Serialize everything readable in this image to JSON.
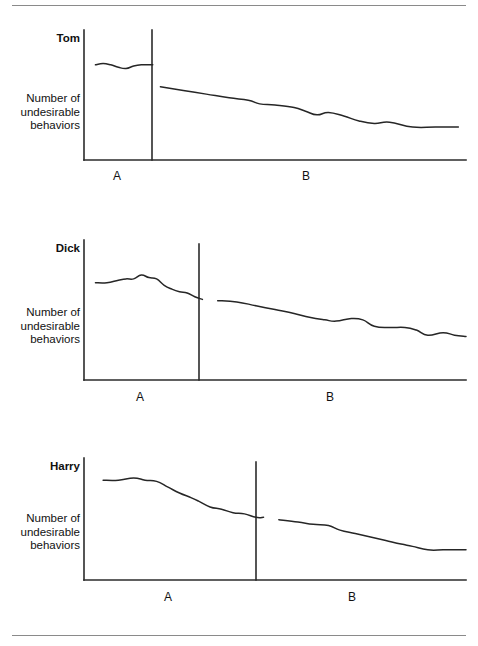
{
  "figure": {
    "title": "",
    "dividers": {
      "top": true,
      "bottom": true
    },
    "panel_count": 3
  },
  "panels": [
    {
      "subject": "Tom",
      "y_axis_label_lines": [
        "Number of",
        "undesirable",
        "behaviors"
      ],
      "phase_labels": {
        "a": "A",
        "b": "B"
      }
    },
    {
      "subject": "Dick",
      "y_axis_label_lines": [
        "Number of",
        "undesirable",
        "behaviors"
      ],
      "phase_labels": {
        "a": "A",
        "b": "B"
      }
    },
    {
      "subject": "Harry",
      "y_axis_label_lines": [
        "Number of",
        "undesirable",
        "behaviors"
      ],
      "phase_labels": {
        "a": "A",
        "b": "B"
      }
    }
  ],
  "chart_data": [
    {
      "type": "line",
      "title": "Tom",
      "xlabel": "",
      "ylabel": "Number of undesirable behaviors",
      "xlim": [
        0,
        100
      ],
      "ylim": [
        0,
        100
      ],
      "grid": false,
      "legend": "none",
      "phase_change_x": 18,
      "phase_labels": [
        "A",
        "B"
      ],
      "annotations": [
        "A",
        "B"
      ],
      "series": [
        {
          "name": "Tom baseline (A)",
          "phase": "A",
          "x": [
            3,
            5,
            7,
            9,
            11,
            13,
            15,
            17,
            18
          ],
          "y": [
            78,
            79,
            78,
            76,
            75,
            77,
            78,
            78,
            78
          ]
        },
        {
          "name": "Tom intervention (B)",
          "phase": "B",
          "x": [
            20,
            26,
            32,
            38,
            43,
            46,
            50,
            55,
            58,
            61,
            64,
            68,
            72,
            76,
            80,
            86,
            92,
            98
          ],
          "y": [
            60,
            57,
            54,
            51,
            49,
            46,
            45,
            43,
            40,
            37,
            39,
            36,
            32,
            30,
            31,
            27,
            27,
            27
          ]
        }
      ]
    },
    {
      "type": "line",
      "title": "Dick",
      "xlabel": "",
      "ylabel": "Number of undesirable behaviors",
      "xlim": [
        0,
        100
      ],
      "ylim": [
        0,
        100
      ],
      "grid": false,
      "legend": "none",
      "phase_change_x": 32,
      "phase_labels": [
        "A",
        "B"
      ],
      "annotations": [
        "A",
        "B"
      ],
      "series": [
        {
          "name": "Dick baseline (A)",
          "phase": "A",
          "x": [
            3,
            6,
            9,
            11,
            13,
            15,
            17,
            19,
            21,
            23,
            25,
            27,
            29,
            31
          ],
          "y": [
            76,
            76,
            78,
            79,
            79,
            82,
            80,
            79,
            74,
            71,
            69,
            68,
            65,
            63
          ]
        },
        {
          "name": "Dick intervention (B)",
          "phase": "B",
          "x": [
            35,
            40,
            45,
            50,
            55,
            59,
            63,
            66,
            70,
            73,
            76,
            80,
            84,
            87,
            90,
            94,
            97,
            100
          ],
          "y": [
            62,
            61,
            58,
            55,
            52,
            49,
            47,
            46,
            48,
            47,
            42,
            41,
            41,
            39,
            35,
            37,
            35,
            34
          ]
        }
      ]
    },
    {
      "type": "line",
      "title": "Harry",
      "xlabel": "",
      "ylabel": "Number of undesirable behaviors",
      "xlim": [
        0,
        100
      ],
      "ylim": [
        0,
        100
      ],
      "grid": false,
      "legend": "none",
      "phase_change_x": 47,
      "phase_labels": [
        "A",
        "B"
      ],
      "annotations": [
        "A",
        "B"
      ],
      "series": [
        {
          "name": "Harry baseline (A)",
          "phase": "A",
          "x": [
            5,
            9,
            13,
            16,
            19,
            22,
            25,
            28,
            30,
            33,
            36,
            39,
            42,
            45,
            47
          ],
          "y": [
            86,
            86,
            88,
            86,
            85,
            80,
            75,
            71,
            68,
            63,
            61,
            58,
            57,
            54,
            54
          ]
        },
        {
          "name": "Harry intervention (B)",
          "phase": "B",
          "x": [
            51,
            56,
            60,
            64,
            67,
            71,
            75,
            79,
            83,
            86,
            90,
            94,
            97,
            100
          ],
          "y": [
            52,
            50,
            48,
            47,
            43,
            40,
            37,
            34,
            31,
            29,
            26,
            26,
            26,
            26
          ]
        }
      ]
    }
  ]
}
